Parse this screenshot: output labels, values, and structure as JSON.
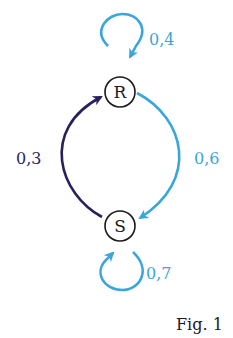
{
  "diagram": {
    "type": "markov-chain",
    "nodes": [
      {
        "id": "R",
        "label": "R"
      },
      {
        "id": "S",
        "label": "S"
      }
    ],
    "edges": [
      {
        "from": "R",
        "to": "R",
        "label": "0,4",
        "color": "#3aa6dc"
      },
      {
        "from": "R",
        "to": "S",
        "label": "0,6",
        "color": "#3aa6dc"
      },
      {
        "from": "S",
        "to": "R",
        "label": "0,3",
        "color": "#2a1f5e"
      },
      {
        "from": "S",
        "to": "S",
        "label": "0,7",
        "color": "#3aa6dc"
      }
    ],
    "caption": "Fig. 1"
  },
  "colors": {
    "light_edge": "#3aa6dc",
    "dark_edge": "#2a1f5e",
    "node_stroke": "#1a1a1a"
  }
}
